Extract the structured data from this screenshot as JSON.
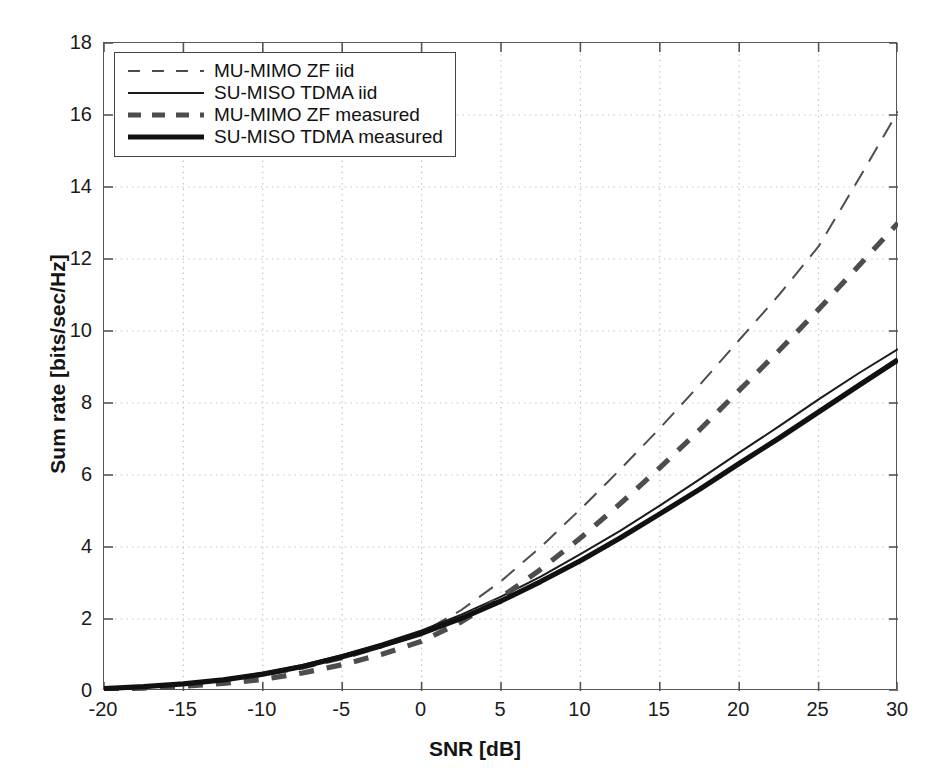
{
  "chart_data": {
    "type": "line",
    "title": "",
    "xlabel": "SNR [dB]",
    "ylabel": "Sum rate [bits/sec/Hz]",
    "xlim": [
      -20,
      30
    ],
    "ylim": [
      0,
      18
    ],
    "xticks": [
      -20,
      -15,
      -10,
      -5,
      0,
      5,
      10,
      15,
      20,
      25,
      30
    ],
    "yticks": [
      0,
      2,
      4,
      6,
      8,
      10,
      12,
      14,
      16,
      18
    ],
    "xtick_labels": [
      "-20",
      "-15",
      "-10",
      "-5",
      "0",
      "5",
      "10",
      "15",
      "20",
      "25",
      "30"
    ],
    "ytick_labels": [
      "0",
      "2",
      "4",
      "6",
      "8",
      "10",
      "12",
      "14",
      "16",
      "18"
    ],
    "grid": true,
    "grid_style": "dotted",
    "grid_color": "#bfbfbf",
    "legend_position": "upper left",
    "x": [
      -20,
      -17.5,
      -15,
      -12.5,
      -10,
      -7.5,
      -5,
      -2.5,
      0,
      2.5,
      5,
      7.5,
      10,
      12.5,
      15,
      17.5,
      20,
      22.5,
      25,
      27.5,
      30
    ],
    "series": [
      {
        "name": "MU-MIMO ZF iid",
        "style": "dashed",
        "width": "thin",
        "color": "#4d4d4d",
        "values": [
          0.06,
          0.1,
          0.17,
          0.27,
          0.42,
          0.62,
          0.88,
          1.22,
          1.62,
          2.25,
          3.05,
          4.0,
          5.05,
          6.15,
          7.3,
          8.5,
          9.75,
          11.0,
          12.35,
          14.2,
          16.1
        ]
      },
      {
        "name": "SU-MISO TDMA iid",
        "style": "solid",
        "width": "thin",
        "color": "#1a1a1a",
        "values": [
          0.08,
          0.13,
          0.21,
          0.33,
          0.5,
          0.72,
          1.0,
          1.32,
          1.68,
          2.12,
          2.62,
          3.18,
          3.8,
          4.45,
          5.15,
          5.88,
          6.62,
          7.35,
          8.1,
          8.82,
          9.5
        ]
      },
      {
        "name": "MU-MIMO ZF measured",
        "style": "dashed",
        "width": "thick",
        "color": "#4d4d4d",
        "values": [
          0.05,
          0.08,
          0.13,
          0.21,
          0.32,
          0.5,
          0.73,
          1.02,
          1.38,
          1.92,
          2.6,
          3.38,
          4.25,
          5.2,
          6.2,
          7.25,
          8.35,
          9.45,
          10.6,
          11.8,
          13.0
        ]
      },
      {
        "name": "SU-MISO TDMA measured",
        "style": "solid",
        "width": "thick",
        "color": "#111111",
        "values": [
          0.07,
          0.12,
          0.2,
          0.31,
          0.47,
          0.68,
          0.95,
          1.26,
          1.6,
          2.02,
          2.5,
          3.04,
          3.62,
          4.25,
          4.92,
          5.6,
          6.32,
          7.02,
          7.75,
          8.48,
          9.2
        ]
      }
    ]
  },
  "legend": {
    "items": [
      {
        "label": "MU-MIMO ZF iid"
      },
      {
        "label": "SU-MISO TDMA iid"
      },
      {
        "label": "MU-MIMO ZF measured"
      },
      {
        "label": "SU-MISO TDMA measured"
      }
    ]
  }
}
